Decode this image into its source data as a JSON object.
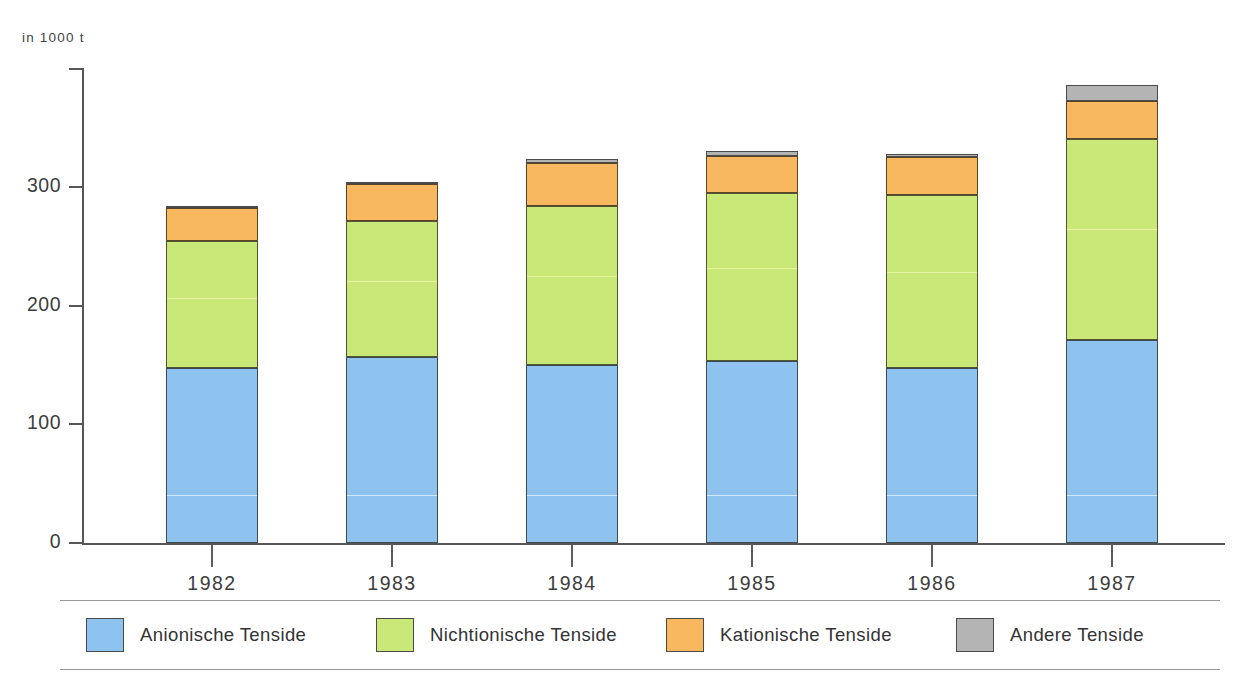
{
  "axis": {
    "unit_label": "in 1000 t",
    "y_ticks": [
      "0",
      "100",
      "200",
      "300"
    ],
    "y_tick_values": [
      0,
      100,
      200,
      300
    ],
    "x_labels": [
      "1982",
      "1983",
      "1984",
      "1985",
      "1986",
      "1987"
    ]
  },
  "legend": {
    "items": [
      {
        "label": "Anionische Tenside",
        "color": "#8dc3ee",
        "key": "anionic"
      },
      {
        "label": "Nichtionische Tenside",
        "color": "#c9e877",
        "key": "nonionic"
      },
      {
        "label": "Kationische Tenside",
        "color": "#f7b860",
        "key": "cationic"
      },
      {
        "label": "Andere Tenside",
        "color": "#b4b4b4",
        "key": "other"
      }
    ]
  },
  "chart_data": {
    "type": "bar",
    "stacked": true,
    "title": "",
    "xlabel": "",
    "ylabel": "in 1000 t",
    "ylim": [
      0,
      400
    ],
    "grid": false,
    "legend_position": "bottom",
    "categories": [
      "1982",
      "1983",
      "1984",
      "1985",
      "1986",
      "1987"
    ],
    "series": [
      {
        "name": "Anionische Tenside",
        "color": "#8dc3ee",
        "values": [
          147,
          157,
          150,
          153,
          147,
          171
        ]
      },
      {
        "name": "Nichtionische Tenside",
        "color": "#c9e877",
        "values": [
          107,
          114,
          134,
          142,
          146,
          169
        ]
      },
      {
        "name": "Kationische Tenside",
        "color": "#f7b860",
        "values": [
          28,
          31,
          36,
          31,
          32,
          32
        ]
      },
      {
        "name": "Andere Tenside",
        "color": "#b4b4b4",
        "values": [
          2,
          2,
          3,
          4,
          3,
          14
        ]
      }
    ],
    "totals": [
      284,
      304,
      323,
      330,
      328,
      386
    ]
  }
}
